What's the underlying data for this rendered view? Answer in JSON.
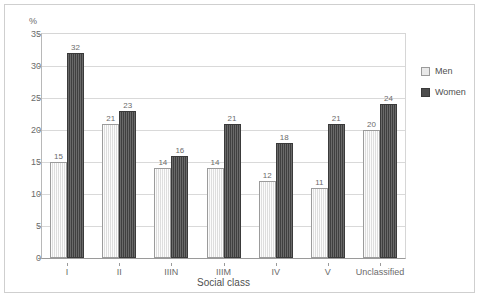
{
  "chart_data": {
    "type": "bar",
    "title": "",
    "subtitle": "",
    "xlabel": "Social class",
    "ylabel": "%",
    "ylim": [
      0,
      35
    ],
    "yticks": [
      0,
      5,
      10,
      15,
      20,
      25,
      30,
      35
    ],
    "ytick_labels": [
      "0",
      "5",
      "10",
      "15",
      "20",
      "25",
      "30",
      "35"
    ],
    "grid": true,
    "grid_axis": "y",
    "legend_position": "right",
    "categories": [
      "I",
      "II",
      "IIIN",
      "IIIM",
      "IV",
      "V",
      "Unclassified"
    ],
    "series": [
      {
        "name": "Men",
        "color": "#e9e9e9",
        "values": [
          15,
          21,
          14,
          14,
          12,
          11,
          20
        ],
        "value_labels": [
          "15",
          "21",
          "14",
          "14",
          "12",
          "11",
          "20"
        ]
      },
      {
        "name": "Women",
        "color": "#4d4d4d",
        "values": [
          32,
          23,
          16,
          21,
          18,
          21,
          24
        ],
        "value_labels": [
          "32",
          "23",
          "16",
          "21",
          "18",
          "21",
          "24"
        ]
      }
    ]
  },
  "legend": {
    "items": [
      {
        "label": "Men",
        "swatch": "men"
      },
      {
        "label": "Women",
        "swatch": "women"
      }
    ]
  },
  "axes": {
    "y_title": "%",
    "x_title": "Social class"
  }
}
